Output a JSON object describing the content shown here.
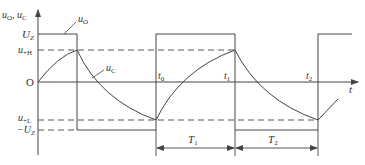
{
  "diagram": {
    "axes": {
      "y_label_main": "u",
      "y_label_sub1": "O",
      "y_label_sep": ", ",
      "y_label_main2": "u",
      "y_label_sub2": "C",
      "x_label": "t",
      "origin_label": "O"
    },
    "levels": {
      "uz_main": "U",
      "uz_sub": "Z",
      "uh_main": "u",
      "uh_sub": "+H",
      "ul_main": "u",
      "ul_sub": "+L",
      "neg_uz_main": "−U",
      "neg_uz_sub": "Z"
    },
    "curves": {
      "uo_main": "u",
      "uo_sub": "O",
      "uc_main": "u",
      "uc_sub": "C"
    },
    "time_marks": {
      "t0_main": "t",
      "t0_sub": "0",
      "t1_main": "t",
      "t1_sub": "1",
      "t2_main": "t",
      "t2_sub": "2"
    },
    "intervals": {
      "T1_main": "T",
      "T1_sub": "1",
      "T2_main": "T",
      "T2_sub": "2"
    },
    "colors": {
      "line": "#444444",
      "text": "#333333"
    }
  }
}
